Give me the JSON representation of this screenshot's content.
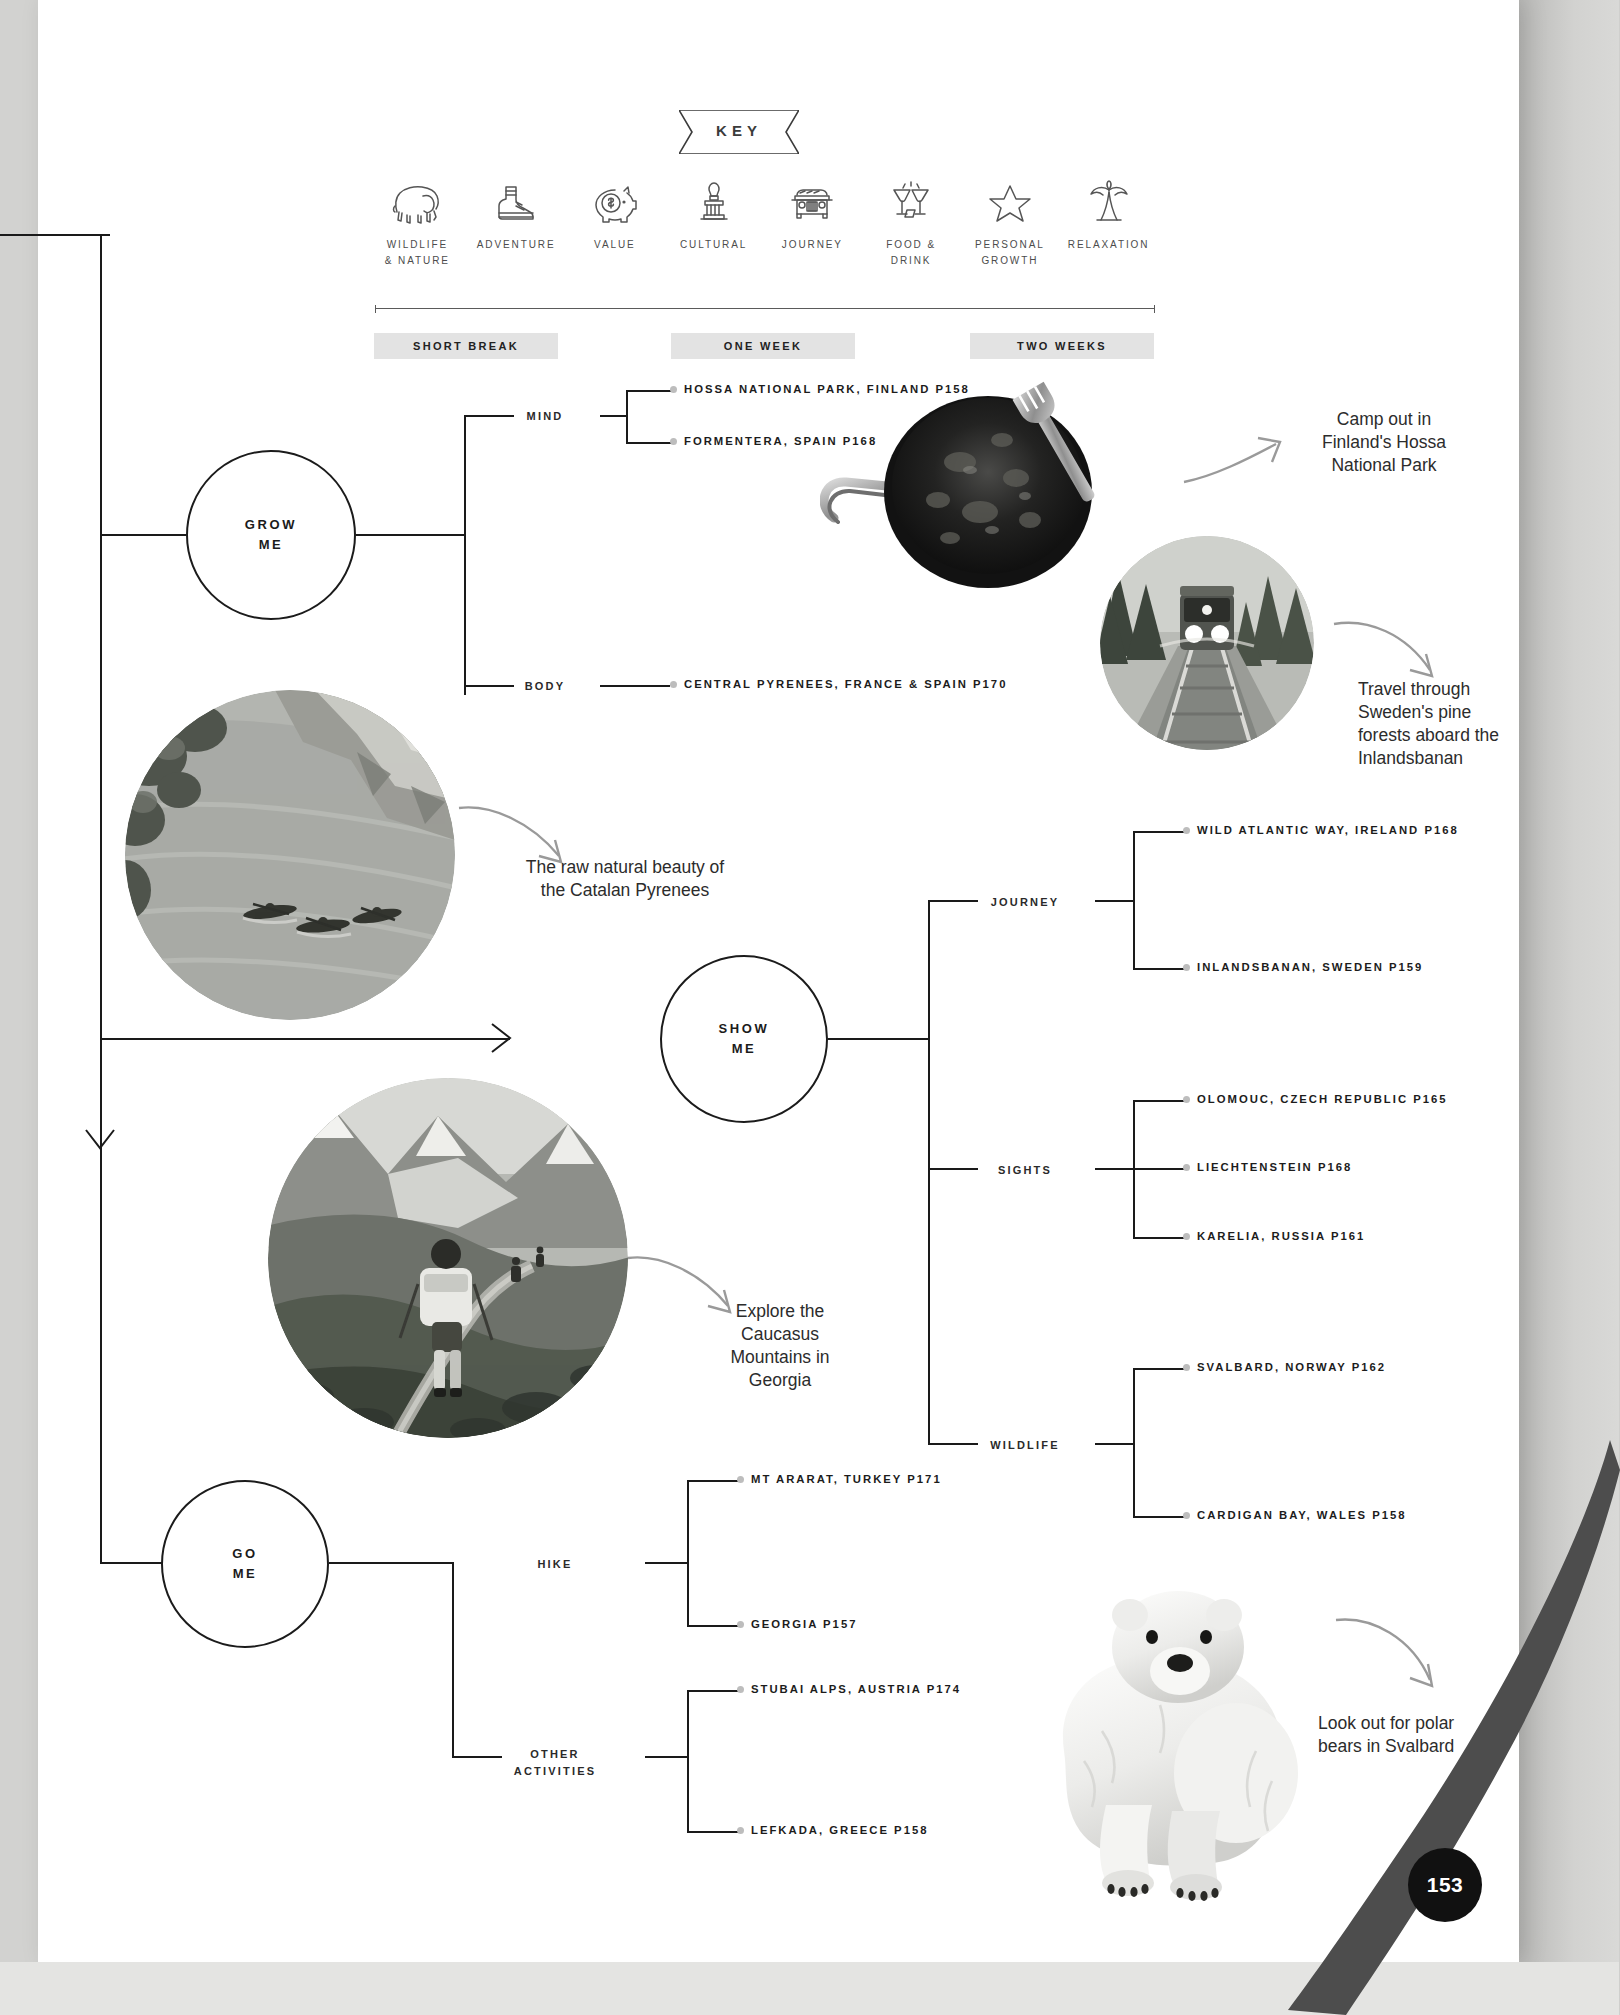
{
  "page": {
    "number": "153"
  },
  "key": {
    "title": "KEY",
    "items": [
      {
        "icon": "elephant-icon",
        "label": "WILDLIFE\n& NATURE"
      },
      {
        "icon": "boot-icon",
        "label": "ADVENTURE"
      },
      {
        "icon": "piggy-bank-icon",
        "label": "VALUE"
      },
      {
        "icon": "monument-icon",
        "label": "CULTURAL"
      },
      {
        "icon": "jeep-icon",
        "label": "JOURNEY"
      },
      {
        "icon": "cheers-icon",
        "label": "FOOD &\nDRINK"
      },
      {
        "icon": "star-icon",
        "label": "PERSONAL\nGROWTH"
      },
      {
        "icon": "palm-tree-icon",
        "label": "RELAXATION"
      }
    ]
  },
  "durations": [
    "SHORT BREAK",
    "ONE WEEK",
    "TWO WEEKS"
  ],
  "hubs": {
    "grow": "GROW\nME",
    "show": "SHOW\nME",
    "go": "GO\nME"
  },
  "branches": {
    "mind": "MIND",
    "body": "BODY",
    "journey": "JOURNEY",
    "sights": "SIGHTS",
    "wildlife": "WILDLIFE",
    "hike": "HIKE",
    "other": "OTHER\nACTIVITIES"
  },
  "destinations": {
    "hossa": "HOSSA NATIONAL PARK, FINLAND P158",
    "formentera": "FORMENTERA, SPAIN P168",
    "pyrenees": "CENTRAL PYRENEES, FRANCE & SPAIN P170",
    "wildatlantic": "WILD ATLANTIC WAY, IRELAND P168",
    "inlandsbanan": "INLANDSBANAN, SWEDEN P159",
    "olomouc": "OLOMOUC, CZECH REPUBLIC P165",
    "liechtenstein": "LIECHTENSTEIN P168",
    "karelia": "KARELIA, RUSSIA P161",
    "svalbard": "SVALBARD, NORWAY P162",
    "cardigan": "CARDIGAN BAY, WALES P158",
    "ararat": "MT ARARAT, TURKEY P171",
    "georgia": "GEORGIA P157",
    "stubai": "STUBAI ALPS, AUSTRIA P174",
    "lefkada": "LEFKADA, GREECE P158"
  },
  "captions": {
    "hossa": "Camp out in\nFinland's Hossa\nNational Park",
    "train": "Travel through\nSweden's pine\nforests aboard the\nInlandsbanan",
    "catalan": "The raw natural beauty of\nthe Catalan Pyrenees",
    "caucasus": "Explore the\nCaucasus\nMountains in\nGeorgia",
    "bear": "Look out for polar\nbears in Svalbard"
  },
  "colors": {
    "ink": "#1b1b1b",
    "chip_bg": "#e3e3e3",
    "dot": "#bdbdbd",
    "paper": "#ffffff",
    "page_badge": "#111111"
  }
}
